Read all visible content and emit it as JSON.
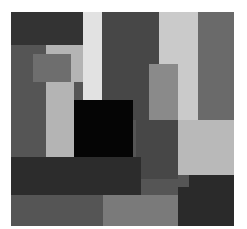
{
  "artwork": {
    "description": "Abstract grayscale composition of overlapping rectangles with a central black square",
    "blocks": [
      {
        "name": "top-left-dark",
        "x": 0,
        "y": 0,
        "w": 72,
        "h": 33,
        "color": "#333333"
      },
      {
        "name": "left-mid-gray-column",
        "x": 0,
        "y": 33,
        "w": 35,
        "h": 124,
        "color": "#555555"
      },
      {
        "name": "light-strip-upper-left",
        "x": 35,
        "y": 33,
        "w": 37,
        "h": 10,
        "color": "#b4b4b4"
      },
      {
        "name": "small-mid-gray-square",
        "x": 22,
        "y": 42,
        "w": 38,
        "h": 28,
        "color": "#6e6e6e"
      },
      {
        "name": "light-column-left",
        "x": 35,
        "y": 70,
        "w": 28,
        "h": 87,
        "color": "#b4b4b4"
      },
      {
        "name": "light-column-left-upper",
        "x": 60,
        "y": 43,
        "w": 12,
        "h": 27,
        "color": "#b4b4b4"
      },
      {
        "name": "white-vertical-strip",
        "x": 72,
        "y": 0,
        "w": 19,
        "h": 88,
        "color": "#e2e2e2"
      },
      {
        "name": "top-center-dark-gray",
        "x": 91,
        "y": 0,
        "w": 57,
        "h": 108,
        "color": "#474747"
      },
      {
        "name": "light-column-right",
        "x": 148,
        "y": 0,
        "w": 39,
        "h": 108,
        "color": "#cacaca"
      },
      {
        "name": "right-gray-column",
        "x": 187,
        "y": 0,
        "w": 36,
        "h": 108,
        "color": "#6a6a6a"
      },
      {
        "name": "gray-rect-right-center",
        "x": 138,
        "y": 52,
        "w": 29,
        "h": 56,
        "color": "#8a8a8a"
      },
      {
        "name": "center-dark-gray-lower",
        "x": 125,
        "y": 108,
        "w": 42,
        "h": 59,
        "color": "#474747"
      },
      {
        "name": "light-square-right",
        "x": 167,
        "y": 108,
        "w": 56,
        "h": 55,
        "color": "#b9b9b9"
      },
      {
        "name": "black-square",
        "x": 63,
        "y": 88,
        "w": 59,
        "h": 57,
        "color": "#050505"
      },
      {
        "name": "wide-dark-band",
        "x": 0,
        "y": 145,
        "w": 130,
        "h": 38,
        "color": "#2c2c2c"
      },
      {
        "name": "bottom-left-gray",
        "x": 0,
        "y": 183,
        "w": 92,
        "h": 31,
        "color": "#555555"
      },
      {
        "name": "bottom-center-lighter",
        "x": 92,
        "y": 183,
        "w": 75,
        "h": 31,
        "color": "#7a7a7a"
      },
      {
        "name": "bottom-right-dark",
        "x": 178,
        "y": 163,
        "w": 45,
        "h": 51,
        "color": "#2a2a2a"
      },
      {
        "name": "bottom-right-dark-ext",
        "x": 167,
        "y": 175,
        "w": 11,
        "h": 39,
        "color": "#2a2a2a"
      }
    ]
  }
}
